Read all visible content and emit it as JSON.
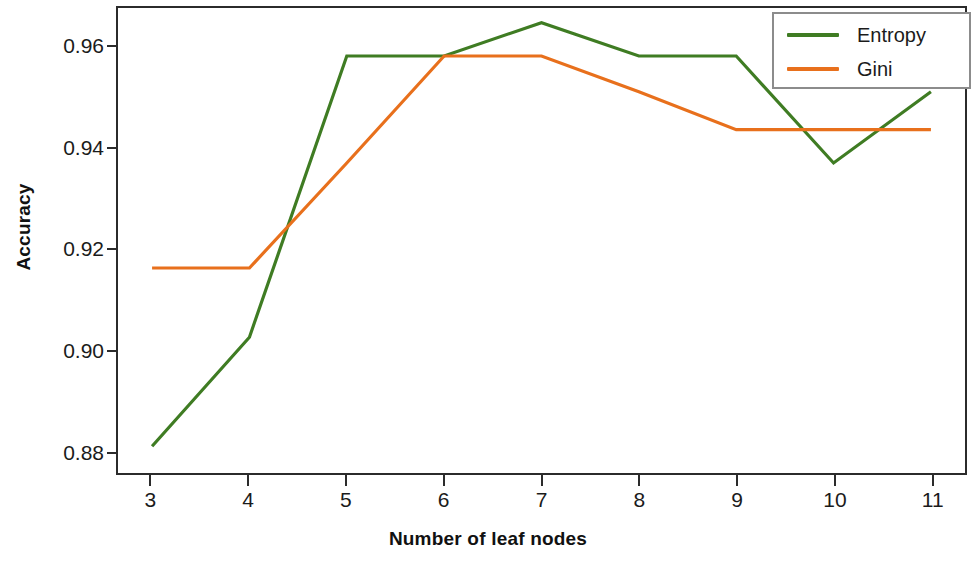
{
  "chart_data": {
    "type": "line",
    "title": "",
    "xlabel": "Number of leaf nodes",
    "ylabel": "Accuracy",
    "x": [
      3,
      4,
      5,
      6,
      7,
      8,
      9,
      10,
      11
    ],
    "xtick_labels": [
      "3",
      "4",
      "5",
      "6",
      "7",
      "8",
      "9",
      "10",
      "11"
    ],
    "ytick_labels": [
      "0.88",
      "0.90",
      "0.92",
      "0.94",
      "0.96"
    ],
    "ytick_values": [
      0.88,
      0.9,
      0.92,
      0.94,
      0.96
    ],
    "xlim": [
      2.65,
      11.35
    ],
    "ylim": [
      0.8757,
      0.9678
    ],
    "grid": false,
    "legend_position": "top-right",
    "series": [
      {
        "name": "Entropy",
        "color": "#3f7c23",
        "values": [
          0.881,
          0.9026,
          0.9583,
          0.9583,
          0.9649,
          0.9583,
          0.9583,
          0.9371,
          0.9512
        ]
      },
      {
        "name": "Gini",
        "color": "#e8701c",
        "values": [
          0.9163,
          0.9163,
          0.9371,
          0.9583,
          0.9583,
          0.9512,
          0.9437,
          0.9437,
          0.9437
        ]
      }
    ]
  },
  "legend": {
    "entries": [
      {
        "label": "Entropy"
      },
      {
        "label": "Gini"
      }
    ]
  },
  "colors": {
    "entropy": "#3f7c23",
    "gini": "#e8701c",
    "axis": "#2b2b2b",
    "legend_border": "#8c8c8c",
    "background": "#ffffff"
  }
}
